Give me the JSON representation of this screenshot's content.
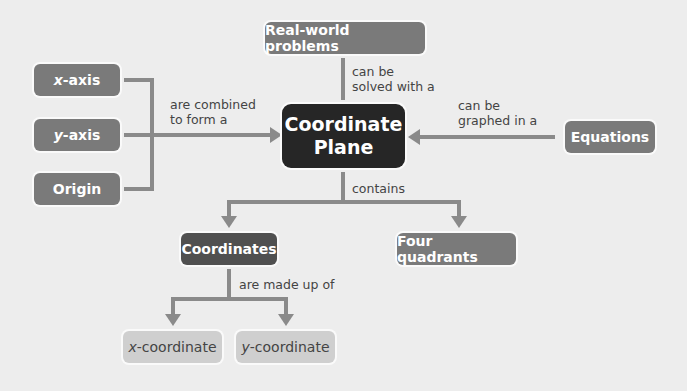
{
  "nodes": {
    "center": {
      "line1": "Coordinate",
      "line2": "Plane"
    },
    "real_world": "Real-world problems",
    "x_axis": {
      "var": "x",
      "rest": "-axis"
    },
    "y_axis": {
      "var": "y",
      "rest": "-axis"
    },
    "origin": "Origin",
    "equations": "Equations",
    "coordinates": "Coordinates",
    "four_quadrants": "Four quadrants",
    "x_coordinate": {
      "var": "x",
      "rest": "-coordinate"
    },
    "y_coordinate": {
      "var": "y",
      "rest": "-coordinate"
    }
  },
  "edges": {
    "combined": {
      "line1": "are combined",
      "line2": "to form a"
    },
    "solved": {
      "line1": "can be",
      "line2": "solved with a"
    },
    "graphed": {
      "line1": "can be",
      "line2": "graphed in a"
    },
    "contains": "contains",
    "made_up": "are made up of"
  },
  "colors": {
    "background": "#ededed",
    "center": "#262626",
    "node": "#7a7a7a",
    "coordinates": "#505050",
    "leaf": "#cfcfcf",
    "connector": "#8a8a8a"
  }
}
